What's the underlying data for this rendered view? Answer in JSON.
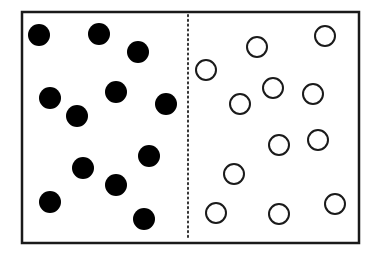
{
  "diagram": {
    "container": {
      "x": 22,
      "y": 12,
      "width": 337,
      "height": 231,
      "stroke": "#1a1a1a"
    },
    "divider": {
      "x": 188,
      "style": "dotted",
      "color": "#333333"
    },
    "left_particles": {
      "type": "filled",
      "color": "#000000",
      "radius": 11,
      "count": 12,
      "points": [
        [
          39,
          35
        ],
        [
          99,
          34
        ],
        [
          138,
          52
        ],
        [
          50,
          98
        ],
        [
          116,
          92
        ],
        [
          77,
          116
        ],
        [
          166,
          104
        ],
        [
          83,
          168
        ],
        [
          149,
          156
        ],
        [
          116,
          185
        ],
        [
          50,
          202
        ],
        [
          144,
          219
        ]
      ]
    },
    "right_particles": {
      "type": "open",
      "color": "#1a1a1a",
      "radius": 10,
      "count": 12,
      "points": [
        [
          206,
          70
        ],
        [
          257,
          47
        ],
        [
          325,
          36
        ],
        [
          240,
          104
        ],
        [
          273,
          88
        ],
        [
          313,
          94
        ],
        [
          279,
          145
        ],
        [
          318,
          140
        ],
        [
          234,
          174
        ],
        [
          216,
          213
        ],
        [
          279,
          214
        ],
        [
          335,
          204
        ]
      ]
    }
  }
}
